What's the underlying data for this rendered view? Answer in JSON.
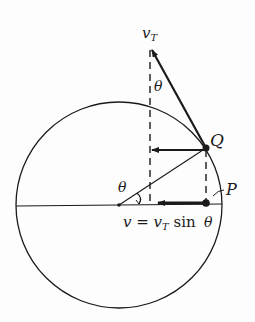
{
  "diagram": {
    "labels": {
      "tangential_velocity": "v",
      "tangential_velocity_sub": "T",
      "angle_top": "θ",
      "angle_center": "θ",
      "angle_bottom": "θ",
      "point_q": "Q",
      "point_p": "P",
      "equation_lhs": "v",
      "equation_eq": " = ",
      "equation_v": "v",
      "equation_sub": "T",
      "equation_sin": " sin "
    },
    "colors": {
      "stroke": "#1a1a1a",
      "background": "#fdfdfd"
    }
  }
}
